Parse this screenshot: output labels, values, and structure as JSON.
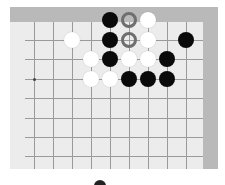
{
  "board": {
    "frame_color": "#b9b9b9",
    "surface_color": "#ececec",
    "line_color": "#9a9a9a",
    "grid": {
      "columns_x": [
        34,
        53,
        72,
        91,
        110,
        129,
        148,
        167,
        186
      ],
      "rows_y": [
        40,
        59,
        79,
        98,
        118,
        137,
        156
      ],
      "line_left": 25,
      "line_right": 203,
      "line_top": 22,
      "line_bottom": 169
    },
    "star_points": [
      {
        "x": 34,
        "y": 79
      }
    ],
    "stones": [
      {
        "color": "black",
        "x": 110,
        "y": 20
      },
      {
        "color": "ring",
        "x": 129,
        "y": 20
      },
      {
        "color": "white",
        "x": 148,
        "y": 20
      },
      {
        "color": "white",
        "x": 72,
        "y": 40
      },
      {
        "color": "black",
        "x": 110,
        "y": 40
      },
      {
        "color": "ring",
        "x": 129,
        "y": 40
      },
      {
        "color": "white",
        "x": 148,
        "y": 40
      },
      {
        "color": "black",
        "x": 186,
        "y": 40
      },
      {
        "color": "white",
        "x": 91,
        "y": 59
      },
      {
        "color": "black",
        "x": 110,
        "y": 59
      },
      {
        "color": "white",
        "x": 129,
        "y": 59
      },
      {
        "color": "white",
        "x": 148,
        "y": 59
      },
      {
        "color": "black",
        "x": 167,
        "y": 59
      },
      {
        "color": "white",
        "x": 91,
        "y": 79
      },
      {
        "color": "white",
        "x": 110,
        "y": 79
      },
      {
        "color": "black",
        "x": 129,
        "y": 79
      },
      {
        "color": "black",
        "x": 148,
        "y": 79
      },
      {
        "color": "black",
        "x": 167,
        "y": 79
      }
    ]
  },
  "indicator": {
    "name": "turn-indicator",
    "color": "#222222"
  }
}
